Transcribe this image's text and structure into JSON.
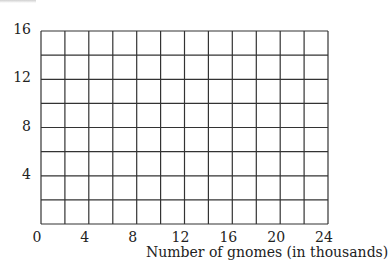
{
  "chart_data": {
    "type": "line",
    "title": "",
    "xlabel": "Number of gnomes (in thousands)",
    "ylabel": "",
    "xlim": [
      0,
      24
    ],
    "ylim": [
      0,
      16
    ],
    "x_ticks": [
      "0",
      "4",
      "8",
      "12",
      "16",
      "20",
      "24"
    ],
    "y_ticks": [
      "4",
      "8",
      "12",
      "16"
    ],
    "x_grid_step": 2,
    "y_grid_step": 2,
    "grid": true,
    "series": [],
    "note": "Blank grid with no plotted data"
  },
  "colors": {
    "grid": "#333333",
    "text": "#222222",
    "background": "#ffffff"
  }
}
